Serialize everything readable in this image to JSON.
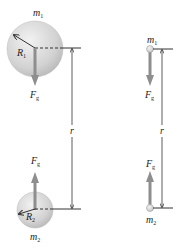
{
  "diagram": {
    "left": {
      "mass1_label": "m",
      "mass1_sub": "1",
      "radius1_label": "R",
      "radius1_sub": "1",
      "force1_label": "F",
      "force1_sub": "g",
      "distance_label": "r",
      "force2_label": "F",
      "force2_sub": "g",
      "radius2_label": "R",
      "radius2_sub": "2",
      "mass2_label": "m",
      "mass2_sub": "2"
    },
    "right": {
      "mass1_label": "m",
      "mass1_sub": "1",
      "force1_label": "F",
      "force1_sub": "g",
      "distance_label": "r",
      "force2_label": "F",
      "force2_sub": "g",
      "mass2_label": "m",
      "mass2_sub": "2"
    },
    "colors": {
      "sphere_fill": "#d4d4d4",
      "sphere_edge": "#b0b0b0",
      "force_arrow": "#8a8a8a",
      "line": "#333333"
    }
  }
}
